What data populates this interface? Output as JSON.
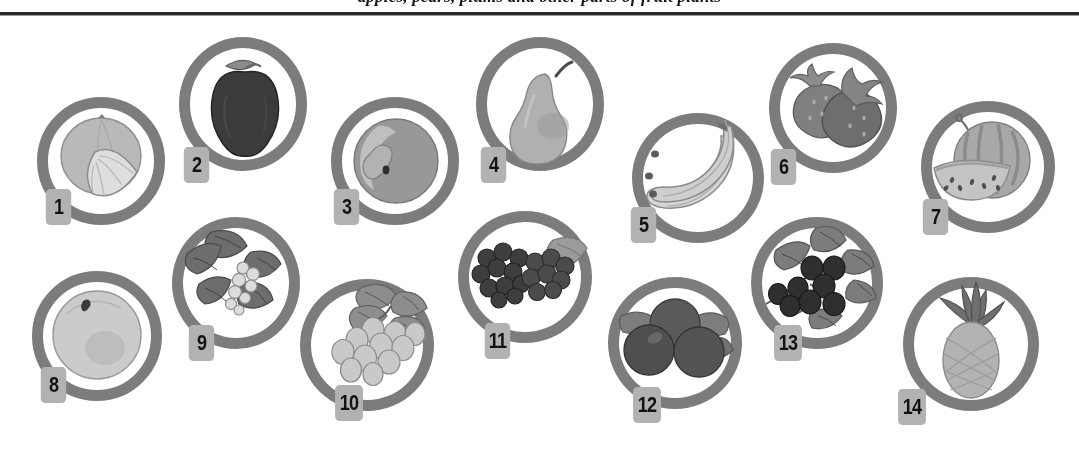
{
  "figure": {
    "caption": "apples, pears, plums and other parts of fruit plants",
    "rule_color": "#2b2b30",
    "ring_color": "#7c7c80",
    "badge_color": "#b2b2b5",
    "badge_text_color": "#121216",
    "background": "#ffffff"
  },
  "items": [
    {
      "number": "1",
      "label": "orange-with-wedge",
      "icon": "orange-icon"
    },
    {
      "number": "2",
      "label": "apple",
      "icon": "apple-icon"
    },
    {
      "number": "3",
      "label": "plum",
      "icon": "plum-icon"
    },
    {
      "number": "4",
      "label": "pear",
      "icon": "pear-icon"
    },
    {
      "number": "5",
      "label": "bananas",
      "icon": "banana-icon"
    },
    {
      "number": "6",
      "label": "strawberries",
      "icon": "strawberry-icon"
    },
    {
      "number": "7",
      "label": "watermelon",
      "icon": "watermelon-icon"
    },
    {
      "number": "8",
      "label": "peach",
      "icon": "peach-icon"
    },
    {
      "number": "9",
      "label": "white-currants",
      "icon": "white-currant-icon"
    },
    {
      "number": "10",
      "label": "green-grapes",
      "icon": "grape-icon"
    },
    {
      "number": "11",
      "label": "blackberries",
      "icon": "blackberry-icon"
    },
    {
      "number": "12",
      "label": "blueberries",
      "icon": "blueberry-icon"
    },
    {
      "number": "13",
      "label": "blackcurrants",
      "icon": "blackcurrant-icon"
    },
    {
      "number": "14",
      "label": "pineapple",
      "icon": "pineapple-icon"
    }
  ]
}
